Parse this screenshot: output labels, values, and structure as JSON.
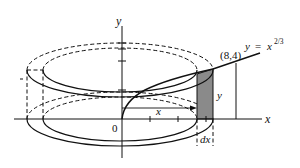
{
  "figure": {
    "curve_label": {
      "lhs": "y",
      "eq": "=",
      "base": "x",
      "exponent": "2/3"
    },
    "point_label": "(8,4)",
    "axis_labels": {
      "x": "x",
      "y": "y"
    },
    "origin_label": "0",
    "shell_labels": {
      "radius": "x",
      "height": "y",
      "thickness": "dx"
    },
    "colors": {
      "line": "#111111",
      "shell_fill": "#8a8a8a",
      "background": "#ffffff"
    }
  }
}
